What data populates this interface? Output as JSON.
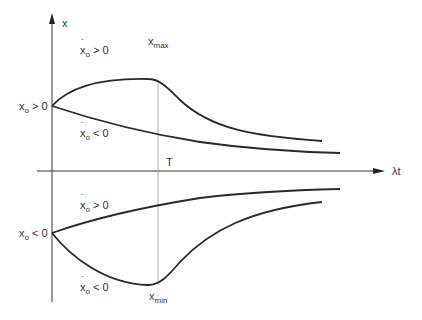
{
  "diagram": {
    "y_axis_label": "x",
    "x_axis_label": "λt",
    "time_marker_label": "T",
    "max_label": {
      "base": "x",
      "sub": "max"
    },
    "min_label": {
      "base": "x",
      "sub": "min"
    },
    "initial_conditions": [
      {
        "base": "x",
        "sub": "o",
        "rel": " > 0"
      },
      {
        "base": "x",
        "sub": "o",
        "rel": " < 0"
      }
    ],
    "curve_labels": [
      {
        "base": "x",
        "sub": "o",
        "rel": " > 0",
        "dot": true
      },
      {
        "base": "x",
        "sub": "o",
        "rel": " < 0",
        "dot": true
      },
      {
        "base": "x",
        "sub": "o",
        "rel": " > 0",
        "dot": true
      },
      {
        "base": "x",
        "sub": "o",
        "rel": " < 0",
        "dot": true
      }
    ],
    "colors": {
      "curve": "#2a2a2a",
      "axis": "#333333",
      "guide": "#999999"
    }
  }
}
